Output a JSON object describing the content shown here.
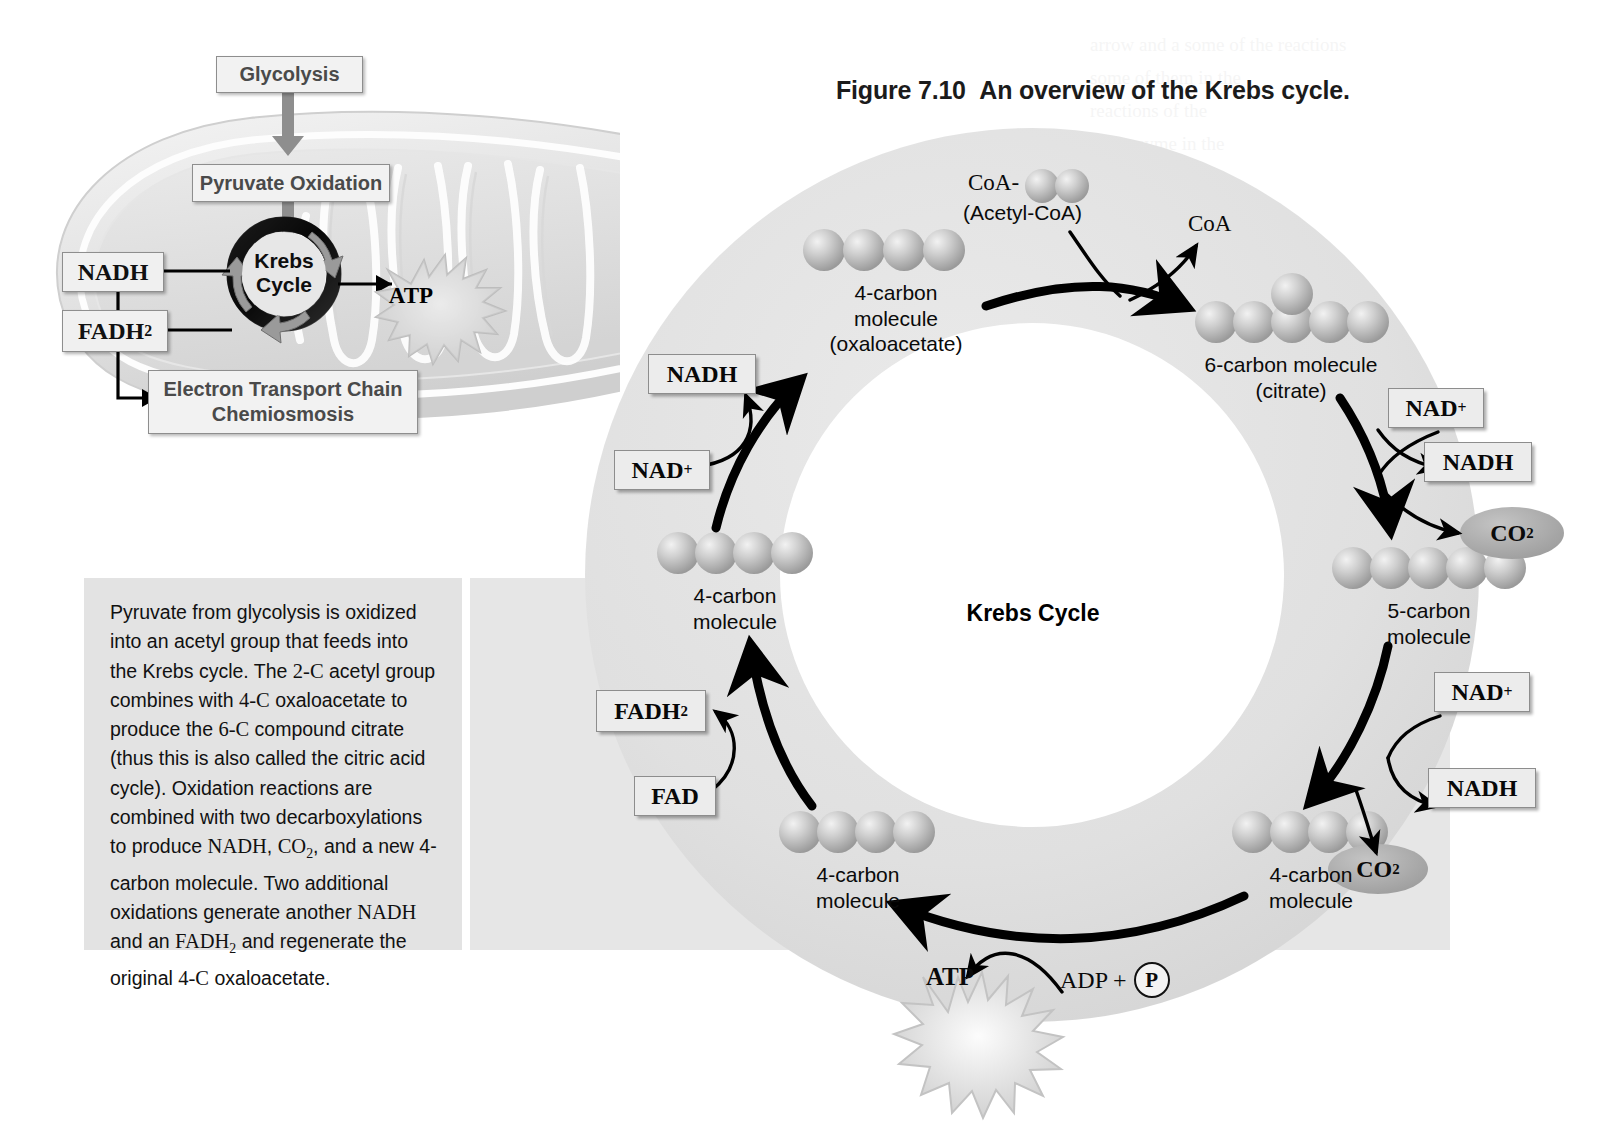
{
  "figure": {
    "number": "Figure 7.10",
    "title": "An overview of the Krebs cycle."
  },
  "caption": {
    "paragraph": "Pyruvate from glycolysis is oxidized into an acetyl group that feeds into the Krebs cycle. The 2-C acetyl group combines with 4-C oxaloacetate to produce the 6-C compound citrate (thus this is also called the citric acid cycle). Oxidation reactions are combined with two decarboxylations to produce NADH, CO2, and a new 4-carbon molecule. Two additional oxidations generate another NADH and an FADH2 and regenerate the original 4-C oxaloacetate."
  },
  "inset": {
    "glycolysis": "Glycolysis",
    "pyruvate_oxidation": "Pyruvate Oxidation",
    "nadh": "NADH",
    "fadh2_main": "FADH",
    "fadh2_sub": "2",
    "etc_line1": "Electron Transport Chain",
    "etc_line2": "Chemiosmosis",
    "krebs_line1": "Krebs",
    "krebs_line2": "Cycle",
    "atp": "ATP"
  },
  "cycle": {
    "center_label": "Krebs Cycle",
    "coa_prefix": "CoA-",
    "acetyl_coa": "(Acetyl-CoA)",
    "coa_out": "CoA",
    "oxaloacetate_l1": "4-carbon",
    "oxaloacetate_l2": "molecule",
    "oxaloacetate_l3": "(oxaloacetate)",
    "citrate_l1": "6-carbon molecule",
    "citrate_l2": "(citrate)",
    "five_carbon_l1": "5-carbon",
    "five_carbon_l2": "molecule",
    "four_carbon_br_l1": "4-carbon",
    "four_carbon_br_l2": "molecule",
    "four_carbon_bl_l1": "4-carbon",
    "four_carbon_bl_l2": "molecule",
    "four_carbon_l_l1": "4-carbon",
    "four_carbon_l_l2": "molecule",
    "nad_plus_tr": "NAD",
    "nad_plus_sup": "+",
    "nadh_tr": "NADH",
    "nad_plus_br": "NAD",
    "nadh_br": "NADH",
    "nad_plus_tl": "NAD",
    "nadh_tl": "NADH",
    "fadh2": "FADH",
    "fadh2_sub": "2",
    "fad": "FAD",
    "co2_main": "CO",
    "co2_sub": "2",
    "atp": "ATP",
    "adp": "ADP +",
    "phosphate": "P"
  },
  "colors": {
    "ring_fill": "#e0e0e0",
    "inner_fill": "#ffffff",
    "co2_fill": "#a8a8a8",
    "box_fill": "#ececec",
    "panel_fill": "#e3e3e3",
    "arrow": "#000000",
    "inset_text": "#4a4a4a"
  },
  "ghost_text": {
    "c1": "arrow and a  some of the reactions\nsome of them in the\nreactions of the\nthe enzyme in the\nthe some of the\n\nreactions",
    "c2": "In Chapter 7 we introduced\nsome reactions\ncatalytic cycle that\nin this to the\nand the in the to\nthe in the of the\n\nin the of reactions",
    "c3": "of the reaction in\nreactions in the of\nthat the on the\nenzyme of to the\nsome in to the"
  }
}
